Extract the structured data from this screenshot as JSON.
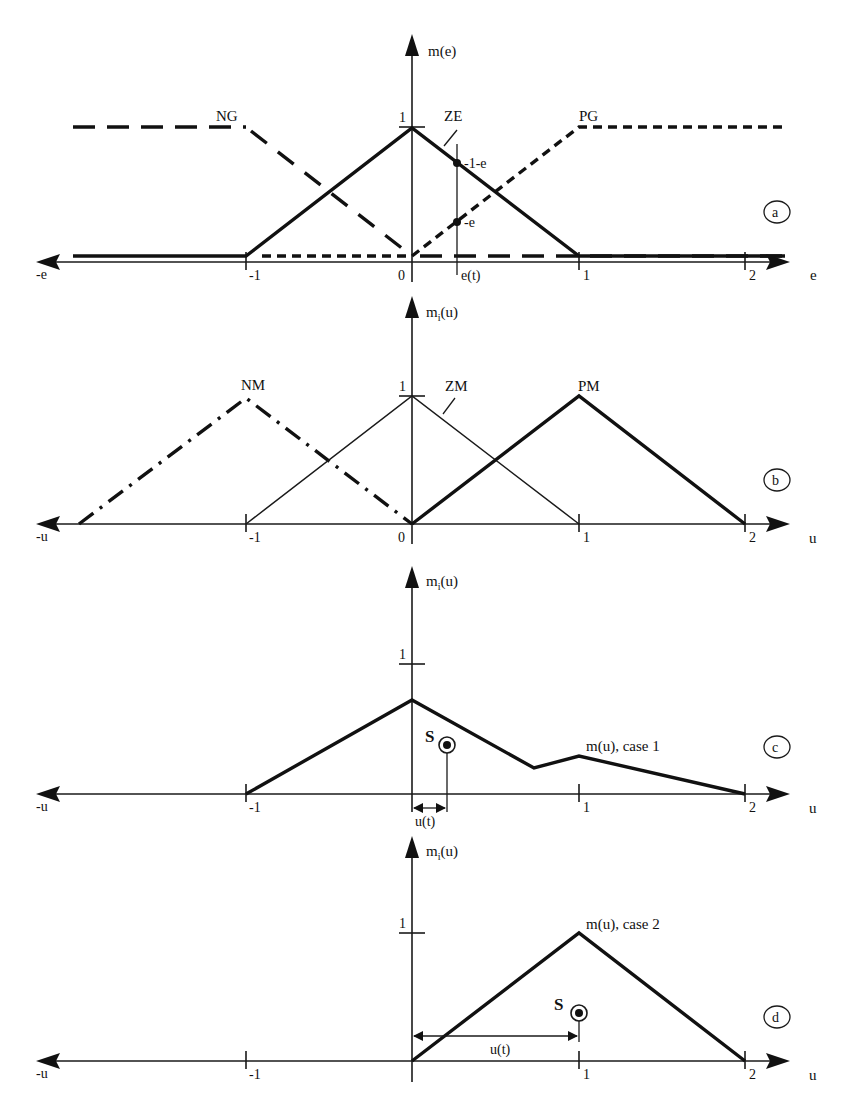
{
  "figure": {
    "panels": [
      {
        "id": "a",
        "badge": "a",
        "y_axis_label": "m(e)",
        "x_axis_label": "e",
        "x_neg_label": "-e",
        "y_tick_label": "1",
        "x_ticks": [
          "-1",
          "0",
          "1",
          "2"
        ],
        "sets": [
          {
            "name": "NG",
            "style": "long-dash",
            "points": [
              [
                -2.0,
                1
              ],
              [
                -1,
                1
              ],
              [
                0,
                0
              ],
              [
                2.25,
                0
              ]
            ]
          },
          {
            "name": "ZE",
            "style": "solid-bold",
            "points": [
              [
                -2.0,
                0
              ],
              [
                -1,
                0
              ],
              [
                0,
                1
              ],
              [
                1,
                0
              ],
              [
                2.25,
                0
              ]
            ]
          },
          {
            "name": "PG",
            "style": "short-dash",
            "points": [
              [
                -1.0,
                0
              ],
              [
                0,
                0
              ],
              [
                1,
                1
              ],
              [
                2.25,
                1
              ]
            ]
          }
        ],
        "annotations": {
          "input_marker": "e(t)",
          "input_value": 0.27,
          "upper_point_label": "1-e",
          "lower_point_label": "e"
        }
      },
      {
        "id": "b",
        "badge": "b",
        "y_axis_label": "m",
        "y_axis_sub": "i",
        "y_axis_suffix": "(u)",
        "x_axis_label": "u",
        "x_neg_label": "-u",
        "y_tick_label": "1",
        "x_ticks": [
          "-1",
          "0",
          "1",
          "2"
        ],
        "sets": [
          {
            "name": "NM",
            "style": "dash-dot-bold",
            "points": [
              [
                -2,
                0
              ],
              [
                -1,
                1
              ],
              [
                0,
                0
              ]
            ]
          },
          {
            "name": "ZM",
            "style": "solid-thin",
            "points": [
              [
                -1,
                0
              ],
              [
                0,
                1
              ],
              [
                1,
                0
              ]
            ]
          },
          {
            "name": "PM",
            "style": "solid-bold",
            "points": [
              [
                0,
                0
              ],
              [
                1,
                1
              ],
              [
                2,
                0
              ]
            ]
          }
        ]
      },
      {
        "id": "c",
        "badge": "c",
        "y_axis_label": "m",
        "y_axis_sub": "i",
        "y_axis_suffix": "(u)",
        "x_axis_label": "u",
        "x_neg_label": "-u",
        "y_tick_label": "1",
        "x_ticks": [
          "-1",
          "1",
          "2"
        ],
        "curve_label": "m(u), case 1",
        "curve_points": [
          [
            -1,
            0
          ],
          [
            0,
            0.73
          ],
          [
            0.73,
            0.16
          ],
          [
            1,
            0.27
          ],
          [
            2,
            0
          ]
        ],
        "centroid_label": "S",
        "centroid": [
          0.21,
          0.38
        ],
        "output_label": "u(t)"
      },
      {
        "id": "d",
        "badge": "d",
        "y_axis_label": "m",
        "y_axis_sub": "i",
        "y_axis_suffix": "(u)",
        "x_axis_label": "u",
        "x_neg_label": "-u",
        "y_tick_label": "1",
        "x_ticks": [
          "-1",
          "1",
          "2"
        ],
        "curve_label": "m(u), case 2",
        "curve_points": [
          [
            0,
            0
          ],
          [
            1,
            1
          ],
          [
            2,
            0
          ]
        ],
        "centroid_label": "S",
        "centroid": [
          1.0,
          0.37
        ],
        "output_label": "u(t)"
      }
    ]
  }
}
